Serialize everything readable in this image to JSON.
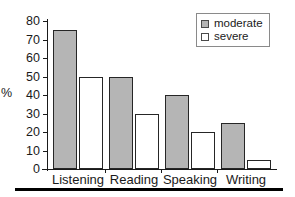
{
  "chart_data": {
    "type": "bar",
    "title": "",
    "subtitle": "",
    "xlabel": "",
    "ylabel": "%",
    "categories": [
      "Listening",
      "Reading",
      "Speaking",
      "Writing"
    ],
    "series": [
      {
        "name": "moderate",
        "values": [
          75,
          50,
          40,
          25
        ],
        "color": "#b5b5b5"
      },
      {
        "name": "severe",
        "values": [
          50,
          30,
          20,
          5
        ],
        "color": "#ffffff"
      }
    ],
    "ylim": [
      0,
      80
    ],
    "ytick_labels": [
      "80",
      "70",
      "60",
      "50",
      "40",
      "30",
      "20",
      "10",
      "0"
    ],
    "ytick_values": [
      80,
      70,
      60,
      50,
      40,
      30,
      20,
      10,
      0
    ],
    "ytick_step": 10,
    "grid": false,
    "legend_position": "top-right",
    "legend_entries": [
      "moderate",
      "severe"
    ],
    "annotations": []
  },
  "axes": {
    "y_title": "%",
    "tick_80": "80",
    "tick_70": "70",
    "tick_60": "60",
    "tick_50": "50",
    "tick_40": "40",
    "tick_30": "30",
    "tick_20": "20",
    "tick_10": "10",
    "tick_0": "0"
  },
  "categories": {
    "c0": "Listening",
    "c1": "Reading",
    "c2": "Speaking",
    "c3": "Writing"
  },
  "legend": {
    "moderate_label": "moderate",
    "severe_label": "severe"
  },
  "colors": {
    "moderate_fill": "#b5b5b5",
    "severe_fill": "#ffffff",
    "bar_stroke": "#262626",
    "axis": "#1a1a1a",
    "rule": "#000000"
  }
}
